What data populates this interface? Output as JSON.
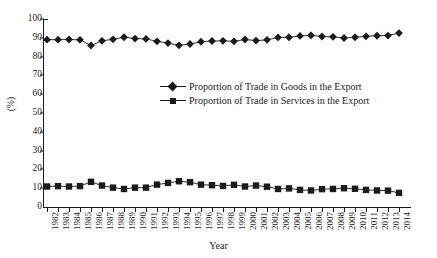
{
  "chart_data": {
    "type": "line",
    "title": "",
    "xlabel": "Year",
    "ylabel": "(%)",
    "ylim": [
      0,
      100
    ],
    "yticks": [
      0,
      10,
      20,
      30,
      40,
      50,
      60,
      70,
      80,
      90,
      100
    ],
    "grid": false,
    "legend_position": "center",
    "x": [
      "1982",
      "1983",
      "1984",
      "1985",
      "1986",
      "1987",
      "1988",
      "1989",
      "1990",
      "1991",
      "1992",
      "1993",
      "1994",
      "1995",
      "1996",
      "1997",
      "1998",
      "1999",
      "2000",
      "2001",
      "2002",
      "2003",
      "2004",
      "2005",
      "2006",
      "2007",
      "2008",
      "2009",
      "2010",
      "2011",
      "2012",
      "2013",
      "2014"
    ],
    "categories": [
      "1982",
      "1983",
      "1984",
      "1985",
      "1986",
      "1987",
      "1988",
      "1989",
      "1990",
      "1991",
      "1992",
      "1993",
      "1994",
      "1995",
      "1996",
      "1997",
      "1998",
      "1999",
      "2000",
      "2001",
      "2002",
      "2003",
      "2004",
      "2005",
      "2006",
      "2007",
      "2008",
      "2009",
      "2010",
      "2011",
      "2012",
      "2013",
      "2014"
    ],
    "series": [
      {
        "name": "Proportion of Trade in Goods in the Export",
        "marker": "diamond",
        "color": "#1a1a1a",
        "values": [
          89.0,
          89.0,
          89.1,
          88.9,
          85.9,
          88.4,
          89.2,
          90.3,
          89.6,
          89.4,
          88.1,
          87.2,
          86.0,
          86.7,
          87.9,
          88.3,
          88.4,
          88.1,
          89.1,
          88.5,
          88.9,
          90.2,
          90.3,
          91.0,
          91.3,
          90.7,
          90.5,
          89.9,
          90.3,
          90.8,
          91.1,
          91.2,
          92.5
        ]
      },
      {
        "name": "Proportion of Trade in Services in the Export",
        "marker": "square",
        "color": "#1a1a1a",
        "values": [
          10.9,
          11.1,
          10.9,
          11.1,
          13.4,
          11.4,
          10.3,
          9.6,
          10.3,
          10.3,
          11.9,
          12.8,
          13.7,
          13.2,
          11.9,
          11.6,
          11.2,
          11.8,
          10.9,
          11.4,
          10.8,
          9.6,
          9.9,
          9.1,
          8.8,
          9.5,
          9.6,
          10.0,
          9.7,
          9.1,
          8.8,
          8.7,
          7.5
        ]
      }
    ]
  },
  "legend": {
    "entries": [
      {
        "label": "Proportion of Trade in Goods in the Export"
      },
      {
        "label": "Proportion of Trade in Services in the Export"
      }
    ]
  },
  "axes": {
    "x_title": "Year",
    "y_title": "(%)"
  }
}
